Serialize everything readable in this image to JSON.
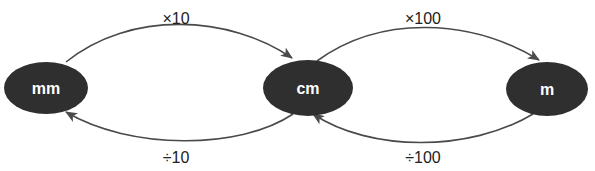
{
  "diagram": {
    "type": "unit-conversion-cycle",
    "colors": {
      "node": "#2f2f2f",
      "node_text": "#ffffff",
      "edge": "#4a4a4a",
      "label": "#222222"
    },
    "nodes": [
      {
        "id": "mm",
        "label": "mm"
      },
      {
        "id": "cm",
        "label": "cm"
      },
      {
        "id": "m",
        "label": "m"
      }
    ],
    "edges": [
      {
        "from": "mm",
        "to": "cm",
        "label": "×10",
        "position": "top"
      },
      {
        "from": "cm",
        "to": "mm",
        "label": "÷10",
        "position": "bottom"
      },
      {
        "from": "cm",
        "to": "m",
        "label": "×100",
        "position": "top"
      },
      {
        "from": "m",
        "to": "cm",
        "label": "÷100",
        "position": "bottom"
      }
    ]
  }
}
